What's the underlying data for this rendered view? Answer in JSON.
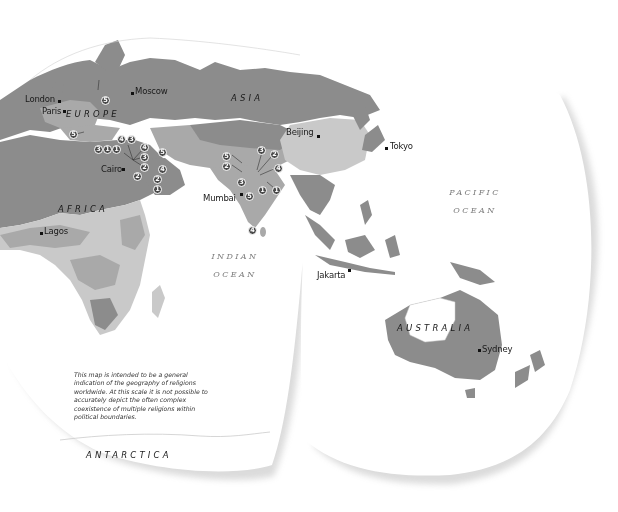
{
  "map": {
    "title": "Geography of religions worldwide",
    "colors": {
      "background": "#ffffff",
      "dark_region": "#8a8a8a",
      "medium_region": "#a9a9a9",
      "light_region": "#c9c9c9",
      "lighter_region": "#dcdcdc",
      "badge": "#4a4a4a",
      "ocean_label": "#7a7a7a"
    },
    "regions": {
      "europe": "EUROPE",
      "asia": "ASIA",
      "africa": "AFRICA",
      "australia": "AUSTRALIA",
      "antarctica": "ANTARCTICA"
    },
    "oceans": {
      "indian_line1": "INDIAN",
      "indian_line2": "OCEAN",
      "pacific_line1": "PACIFIC",
      "pacific_line2": "OCEAN"
    },
    "cities": {
      "london": "London",
      "paris": "Paris",
      "moscow": "Moscow",
      "cairo": "Cairo",
      "lagos": "Lagos",
      "beijing": "Beijing",
      "tokyo": "Tokyo",
      "mumbai": "Mumbai",
      "jakarta": "Jakarta",
      "sydney": "Sydney"
    },
    "markers": [
      {
        "id": "europe-central",
        "value": "5"
      },
      {
        "id": "italy",
        "value": "5"
      },
      {
        "id": "levant-a",
        "value": "3"
      },
      {
        "id": "levant-b",
        "value": "1"
      },
      {
        "id": "levant-c",
        "value": "1"
      },
      {
        "id": "anatolia-a",
        "value": "4"
      },
      {
        "id": "anatolia-b",
        "value": "3"
      },
      {
        "id": "mesopotamia-a",
        "value": "4"
      },
      {
        "id": "mesopotamia-b",
        "value": "3"
      },
      {
        "id": "mesopotamia-c",
        "value": "2"
      },
      {
        "id": "sinai",
        "value": "2"
      },
      {
        "id": "persia-a",
        "value": "5"
      },
      {
        "id": "persia-b",
        "value": "4"
      },
      {
        "id": "arabia-a",
        "value": "2"
      },
      {
        "id": "arabia-b",
        "value": "1"
      },
      {
        "id": "india-a",
        "value": "5"
      },
      {
        "id": "india-b",
        "value": "2"
      },
      {
        "id": "india-c",
        "value": "3"
      },
      {
        "id": "india-d",
        "value": "2"
      },
      {
        "id": "india-e",
        "value": "4"
      },
      {
        "id": "india-f",
        "value": "3"
      },
      {
        "id": "india-g",
        "value": "5"
      },
      {
        "id": "india-h",
        "value": "1"
      },
      {
        "id": "india-i",
        "value": "1"
      },
      {
        "id": "srilanka",
        "value": "4"
      }
    ],
    "note": "This map is intended to be a general indication of the geography of religions worldwide. At this scale it is not possible to accurately depict the often complex coexistence of multiple religions within political boundaries."
  }
}
